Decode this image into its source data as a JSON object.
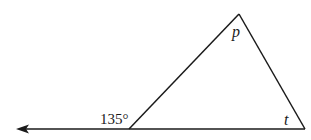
{
  "diagram": {
    "type": "geometry-triangle",
    "colors": {
      "stroke": "#1a1a1a",
      "background": "#ffffff"
    },
    "labels": {
      "exterior_angle": "135°",
      "apex_angle": "p",
      "right_angle": "t"
    },
    "vertices": {
      "left": [
        129,
        129
      ],
      "apex": [
        239,
        14
      ],
      "right": [
        305,
        129
      ]
    },
    "ray": {
      "from": [
        129,
        129
      ],
      "to": [
        16,
        129
      ],
      "direction": "left"
    }
  }
}
